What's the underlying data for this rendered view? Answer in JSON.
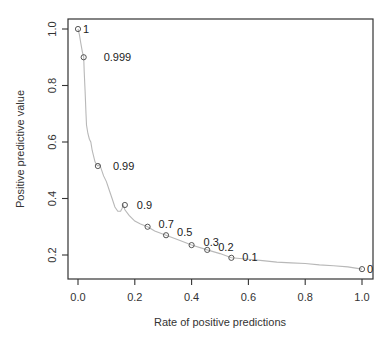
{
  "chart_data": {
    "type": "line",
    "title": "",
    "xlabel": "Rate of positive predictions",
    "ylabel": "Positive predictive value",
    "xlim": [
      -0.035,
      1.04
    ],
    "ylim": [
      0.125,
      1.035
    ],
    "x_ticks": [
      0.0,
      0.2,
      0.4,
      0.6,
      0.8,
      1.0
    ],
    "x_tick_labels": [
      "0.0",
      "0.2",
      "0.4",
      "0.6",
      "0.8",
      "1.0"
    ],
    "y_ticks": [
      0.2,
      0.4,
      0.6,
      0.8,
      1.0
    ],
    "y_tick_labels": [
      "0.2",
      "0.4",
      "0.6",
      "0.8",
      "1.0"
    ],
    "grid": false,
    "legend": "none",
    "curve": {
      "name": "performance curve",
      "color": "#b8b8b8",
      "x": [
        0.0,
        0.005,
        0.01,
        0.015,
        0.02,
        0.022,
        0.025,
        0.028,
        0.03,
        0.035,
        0.04,
        0.045,
        0.05,
        0.055,
        0.06,
        0.065,
        0.07,
        0.075,
        0.08,
        0.09,
        0.1,
        0.11,
        0.12,
        0.13,
        0.14,
        0.15,
        0.155,
        0.16,
        0.165,
        0.18,
        0.2,
        0.22,
        0.245,
        0.27,
        0.31,
        0.35,
        0.4,
        0.455,
        0.5,
        0.54,
        0.6,
        0.65,
        0.7,
        0.75,
        0.8,
        0.85,
        0.9,
        0.95,
        1.0
      ],
      "y": [
        1.0,
        0.98,
        0.95,
        0.92,
        0.9,
        0.85,
        0.78,
        0.7,
        0.66,
        0.63,
        0.61,
        0.6,
        0.57,
        0.55,
        0.53,
        0.52,
        0.515,
        0.52,
        0.51,
        0.48,
        0.46,
        0.43,
        0.4,
        0.37,
        0.355,
        0.355,
        0.365,
        0.377,
        0.36,
        0.34,
        0.32,
        0.31,
        0.3,
        0.285,
        0.27,
        0.255,
        0.235,
        0.218,
        0.205,
        0.19,
        0.185,
        0.18,
        0.175,
        0.172,
        0.17,
        0.165,
        0.162,
        0.158,
        0.15
      ]
    },
    "points": [
      {
        "label": "1",
        "x": 0.0,
        "y": 1.0
      },
      {
        "label": "0.999",
        "x": 0.02,
        "y": 0.9
      },
      {
        "label": "0.99",
        "x": 0.07,
        "y": 0.515
      },
      {
        "label": "0.9",
        "x": 0.165,
        "y": 0.377
      },
      {
        "label": "0.7",
        "x": 0.245,
        "y": 0.3
      },
      {
        "label": "0.5",
        "x": 0.31,
        "y": 0.27
      },
      {
        "label": "0.3",
        "x": 0.4,
        "y": 0.235
      },
      {
        "label": "0.2",
        "x": 0.455,
        "y": 0.218
      },
      {
        "label": "0.1",
        "x": 0.54,
        "y": 0.19
      },
      {
        "label": "0",
        "x": 1.0,
        "y": 0.15
      }
    ]
  }
}
